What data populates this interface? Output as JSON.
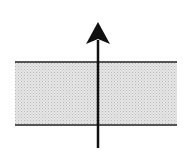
{
  "diagram": {
    "canvas": {
      "width": 196,
      "height": 166,
      "background": "#ffffff"
    },
    "layer": {
      "x_start": 15,
      "x_end": 177,
      "top_y": 62,
      "bottom_y": 125,
      "fill": "#e4e4e4",
      "dot_color": "#bdbdbd",
      "border_color": "#555555"
    },
    "arrow": {
      "x": 98,
      "tail_y": 148,
      "tip_y": 22,
      "head_width": 24,
      "head_length": 22,
      "direction": "up",
      "color": "#111111"
    }
  }
}
